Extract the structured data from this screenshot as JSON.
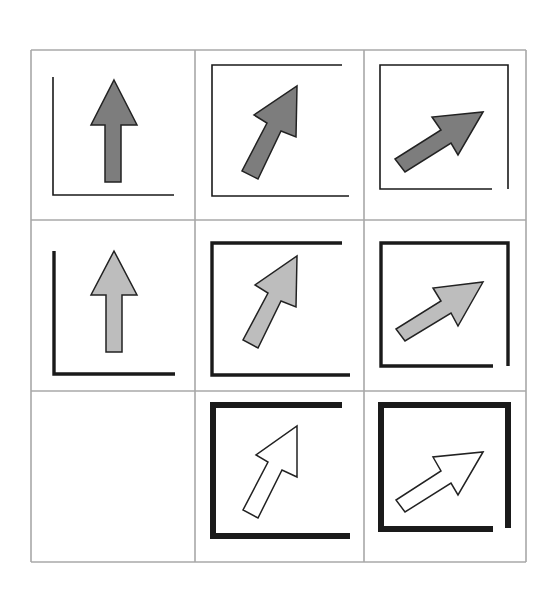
{
  "figure": {
    "title": "",
    "background": "#ffffff",
    "grid": {
      "stroke": "#a8a8a8",
      "stroke_width": 1.6,
      "col_lines": [
        31,
        195,
        364,
        526
      ],
      "row_lines": [
        50,
        220,
        391,
        562
      ]
    },
    "colors": {
      "frame": "#1a1a1a",
      "arrow_outline": "#222222",
      "fill_dark": "#7d7d7d",
      "fill_light": "#bdbdbd",
      "fill_white": "#ffffff"
    },
    "rows": [
      {
        "label": "dark-fill-thin-frame",
        "frame_width": 1.6,
        "fill": "#7d7d7d"
      },
      {
        "label": "light-fill-medium-frame",
        "frame_width": 3.4,
        "fill": "#bdbdbd"
      },
      {
        "label": "white-fill-thick-frame",
        "frame_width": 6,
        "fill": "#ffffff"
      }
    ],
    "cells": [
      {
        "id": "r1c1",
        "row": 0,
        "col": 0,
        "arrow": "up",
        "frame_paths": [
          "M53 77 L53 195 L174 195"
        ],
        "arrow_points": "114,80 137,125 121,125 121,182 105,182 105,125 91,125"
      },
      {
        "id": "r1c2",
        "row": 0,
        "col": 1,
        "arrow": "up-right-steep",
        "frame_paths": [
          "M342 65 L212 65 L212 196 L349 196"
        ],
        "arrow_points": "297,86 296,137 281,131 258,179 242,171 267,123 254,115"
      },
      {
        "id": "r1c3",
        "row": 0,
        "col": 2,
        "arrow": "up-right-shallow",
        "frame_paths": [
          "M492 189 L380 189 L380 65 L508 65 L508 189"
        ],
        "arrow_points": "483,112 458,155 451,143 405,172 395,159 441,130 432,117"
      },
      {
        "id": "r2c1",
        "row": 1,
        "col": 0,
        "arrow": "up",
        "frame_paths": [
          "M54 251 L54 374 L175 374"
        ],
        "arrow_points": "114,251 137,295 122,295 122,352 106,352 106,295 91,295"
      },
      {
        "id": "r2c2",
        "row": 1,
        "col": 1,
        "arrow": "up-right-steep",
        "frame_paths": [
          "M342 243 L212 243 L212 375 L350 375"
        ],
        "arrow_points": "297,256 296,307 281,301 258,348 243,340 268,293 255,285"
      },
      {
        "id": "r2c3",
        "row": 1,
        "col": 2,
        "arrow": "up-right-shallow",
        "frame_paths": [
          "M493 366 L381 366 L381 243 L508 243 L508 366"
        ],
        "arrow_points": "483,282 458,326 451,313 405,341 396,329 441,301 433,288"
      },
      {
        "id": "r3c1",
        "row": 2,
        "col": 0,
        "arrow": "none",
        "frame_paths": [],
        "arrow_points": ""
      },
      {
        "id": "r3c2",
        "row": 2,
        "col": 1,
        "arrow": "up-right-steep",
        "frame_paths": [
          "M342 405 L213 405 L213 536 L350 536"
        ],
        "arrow_points": "297,426 297,477 282,470 258,518 243,510 268,462 256,455"
      },
      {
        "id": "r3c3",
        "row": 2,
        "col": 2,
        "arrow": "up-right-shallow",
        "frame_paths": [
          "M493 529 L381 529 L381 405 L508 405 L508 528"
        ],
        "arrow_points": "483,452 458,495 451,483 405,512 396,500 441,471 433,457"
      }
    ]
  }
}
